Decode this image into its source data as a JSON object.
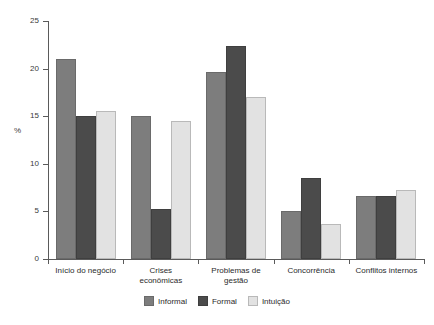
{
  "chart_data": {
    "type": "bar",
    "title": "",
    "xlabel": "",
    "ylabel": "%",
    "ylim": [
      0,
      25
    ],
    "yticks": [
      0,
      5,
      10,
      15,
      20,
      25
    ],
    "ytick_labels": [
      "0",
      "5",
      "10",
      "15",
      "20",
      "25"
    ],
    "grid": false,
    "legend_position": "bottom-center",
    "categories": [
      "Início do negócio",
      "Crises econômicas",
      "Problemas de gestão",
      "Concorrência",
      "Conflitos internos"
    ],
    "category_lines": [
      [
        "Início do negócio"
      ],
      [
        "Crises",
        "econômicas"
      ],
      [
        "Problemas de",
        "gestão"
      ],
      [
        "Concorrência"
      ],
      [
        "Conflitos internos"
      ]
    ],
    "series": [
      {
        "name": "Informal",
        "color": "#7d7d7d",
        "values": [
          21.0,
          15.0,
          19.6,
          5.0,
          6.6
        ]
      },
      {
        "name": "Formal",
        "color": "#4b4b4b",
        "values": [
          15.0,
          5.3,
          22.4,
          8.5,
          6.6
        ]
      },
      {
        "name": "Intuição",
        "color": "#e2e2e2",
        "values": [
          15.5,
          14.5,
          17.0,
          3.7,
          7.2
        ]
      }
    ]
  },
  "axis": {
    "unit_label": "%"
  },
  "legend": {
    "items": [
      {
        "label": "Informal",
        "key": "informal"
      },
      {
        "label": "Formal",
        "key": "formal"
      },
      {
        "label": "Intuição",
        "key": "intuicao"
      }
    ]
  }
}
